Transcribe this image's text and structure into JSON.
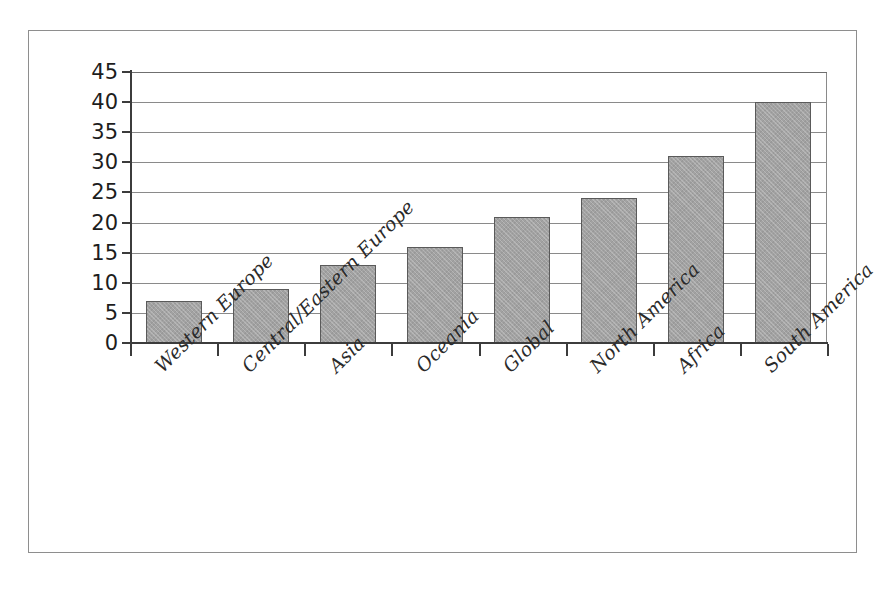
{
  "chart_data": {
    "type": "bar",
    "title": "",
    "subtitle": "",
    "xlabel": "",
    "ylabel": "",
    "categories": [
      "Western Europe",
      "Central/Eastern Europe",
      "Asia",
      "Oceania",
      "Global",
      "North America",
      "Africa",
      "South America"
    ],
    "values": [
      7,
      9,
      13,
      16,
      21,
      24,
      31,
      40
    ],
    "ylim": [
      0,
      45
    ],
    "ytick_labels": [
      "45",
      "40",
      "35",
      "30",
      "25",
      "20",
      "15",
      "10",
      "5",
      "0"
    ],
    "ytick_values": [
      45,
      40,
      35,
      30,
      25,
      20,
      15,
      10,
      5,
      0
    ],
    "ytick_step": 5,
    "grid": "horizontal",
    "legend": "none",
    "orientation": "vertical",
    "xtick_label_rotation": -45,
    "annotations": [],
    "colors": {
      "bar_fill": "#a2a2a2",
      "bar_border": "#5a5a5a",
      "gridline": "#8a8a8a",
      "axis": "#3c3c3c",
      "frame": "#8e8e8e",
      "background": "#ffffff",
      "tick_label": "#1d1d1d",
      "category_label": "#2a2a2a"
    }
  }
}
